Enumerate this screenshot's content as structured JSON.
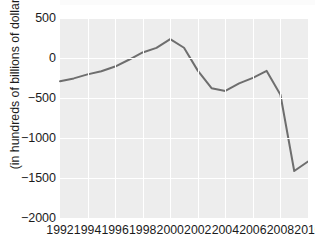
{
  "chart_data": {
    "type": "line",
    "title": "",
    "subtitle": "",
    "xlabel": "",
    "ylabel": "(in hundreds of billions of dollars)",
    "xlim": [
      1992,
      2010
    ],
    "ylim": [
      -2000,
      500
    ],
    "grid": true,
    "legend": null,
    "xtick_labels": [
      "1992",
      "1994",
      "1996",
      "1998",
      "2000",
      "2002",
      "2004",
      "2006",
      "2008",
      "2010"
    ],
    "xticks": [
      1992,
      1994,
      1996,
      1998,
      2000,
      2002,
      2004,
      2006,
      2008,
      2010
    ],
    "ytick_labels": [
      "500",
      "0",
      "−500",
      "−1000",
      "−1500",
      "−2000"
    ],
    "yticks": [
      500,
      0,
      -500,
      -1000,
      -1500,
      -2000
    ],
    "series": [
      {
        "name": "Federal budget balance",
        "color": "#6e6e6e",
        "x": [
          1992,
          1993,
          1994,
          1995,
          1996,
          1997,
          1998,
          1999,
          2000,
          2001,
          2002,
          2003,
          2004,
          2005,
          2006,
          2007,
          2008,
          2009,
          2010
        ],
        "values": [
          -290,
          -255,
          -205,
          -165,
          -107,
          -22,
          69,
          126,
          236,
          128,
          -158,
          -378,
          -412,
          -318,
          -248,
          -161,
          -459,
          -1413,
          -1294
        ]
      }
    ],
    "annotations": []
  },
  "axis": {
    "y_title": "(in hundreds of billions of dollars)"
  }
}
